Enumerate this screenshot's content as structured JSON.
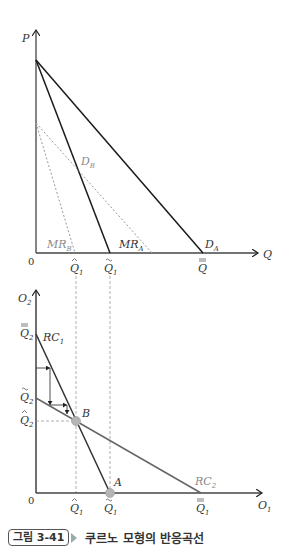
{
  "figure": {
    "number": "그림 3-41",
    "title": "쿠르노 모형의 반응곡선"
  },
  "top_chart": {
    "y_axis_label": "P",
    "x_axis_label": "Q",
    "origin": "0",
    "curves": {
      "DA": "D",
      "DA_sub": "A",
      "MRA": "MR",
      "MRA_sub": "A",
      "DB": "D",
      "DB_sub": "B",
      "MRB": "MR",
      "MRB_sub": "B"
    },
    "x_ticks": [
      {
        "base": "Q",
        "sub": "1",
        "accent": "hat"
      },
      {
        "base": "Q",
        "sub": "1",
        "accent": "tilde"
      },
      {
        "base": "Q",
        "sub": "",
        "accent": "double-bar"
      }
    ]
  },
  "bottom_chart": {
    "y_axis_label": "O",
    "y_axis_sub": "2",
    "x_axis_label": "O",
    "x_axis_sub": "1",
    "origin": "0",
    "curves": {
      "RC1": "RC",
      "RC1_sub": "1",
      "RC2": "RC",
      "RC2_sub": "2"
    },
    "points": {
      "A": "A",
      "B": "B"
    },
    "y_ticks": [
      {
        "base": "Q",
        "sub": "2",
        "accent": "double-bar"
      },
      {
        "base": "Q",
        "sub": "2",
        "accent": "tilde"
      },
      {
        "base": "Q",
        "sub": "2",
        "accent": "hat"
      }
    ],
    "x_ticks": [
      {
        "base": "Q",
        "sub": "1",
        "accent": "hat"
      },
      {
        "base": "Q",
        "sub": "1",
        "accent": "tilde"
      },
      {
        "base": "Q",
        "sub": "1",
        "accent": "double-bar"
      }
    ]
  },
  "colors": {
    "line_dark": "#1a1a1a",
    "line_gray": "#707070",
    "dashed": "#9a9a9a",
    "point": "#b5b5b5"
  }
}
